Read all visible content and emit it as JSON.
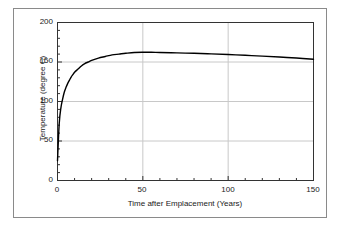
{
  "chart_data": {
    "type": "line",
    "title": "",
    "xlabel": "Time after Emplacement (Years)",
    "ylabel": "Temperature (degree C)",
    "xlim": [
      0,
      150
    ],
    "ylim": [
      0,
      200
    ],
    "x_major_ticks": [
      0,
      50,
      100,
      150
    ],
    "x_tick_labels": [
      "0",
      "50",
      "100",
      "150"
    ],
    "x_minor_tick_interval": 10,
    "y_major_ticks": [
      0,
      50,
      100,
      150,
      200
    ],
    "y_tick_labels": [
      "0",
      "50",
      "100",
      "150",
      "200"
    ],
    "y_minor_tick_interval": 10,
    "grid": {
      "horizontal": true,
      "vertical": true,
      "color": "#c8c8c8"
    },
    "legend": null,
    "series": [
      {
        "name": "Temperature",
        "color": "#000000",
        "line_width": 1.4,
        "x": [
          0,
          1,
          2,
          3,
          4,
          5,
          6,
          7,
          8,
          9,
          10,
          12,
          14,
          16,
          18,
          20,
          24,
          28,
          32,
          36,
          40,
          45,
          50,
          55,
          60,
          70,
          80,
          90,
          100,
          110,
          120,
          130,
          140,
          150
        ],
        "y": [
          25,
          72,
          92,
          103,
          112,
          118,
          123,
          127,
          131,
          134,
          137,
          141,
          145,
          148,
          150,
          152,
          155,
          157,
          159,
          160,
          161,
          162,
          162.3,
          162.3,
          162,
          161.5,
          161,
          160.3,
          159.5,
          158.5,
          157.5,
          156.3,
          155,
          153.5
        ]
      }
    ]
  },
  "figure": {
    "frame_color": "#8a8a8a",
    "background": "#ffffff",
    "axis_color": "#333333"
  }
}
